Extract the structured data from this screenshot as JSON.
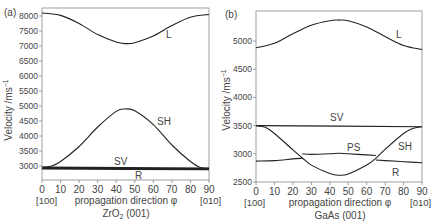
{
  "chart_data": [
    {
      "type": "line",
      "panel_label": "(a)",
      "title": "ZrO2 (001)",
      "xlabel": "propagation direction φ",
      "ylabel": "Velocity /ms⁻¹",
      "xlim": [
        0,
        90
      ],
      "ylim": [
        2530,
        8250
      ],
      "x_ticks": [
        0,
        10,
        20,
        30,
        40,
        50,
        60,
        70,
        80,
        90
      ],
      "y_ticks": [
        3000,
        3500,
        4000,
        4500,
        5000,
        5500,
        6000,
        6500,
        7000,
        7500,
        8000
      ],
      "x_end_labels": [
        "[100]",
        "[010]"
      ],
      "grid": false,
      "series": [
        {
          "name": "L",
          "x": [
            0,
            10,
            20,
            30,
            40,
            45,
            50,
            60,
            70,
            80,
            90
          ],
          "values": [
            8100,
            8020,
            7750,
            7380,
            7130,
            7080,
            7110,
            7330,
            7680,
            7960,
            8050
          ]
        },
        {
          "name": "SH",
          "x": [
            0,
            5,
            10,
            20,
            30,
            40,
            45,
            50,
            60,
            70,
            80,
            85,
            90
          ],
          "values": [
            2950,
            3000,
            3150,
            3650,
            4300,
            4820,
            4900,
            4840,
            4380,
            3700,
            3150,
            2960,
            2920
          ]
        },
        {
          "name": "SV",
          "x": [
            0,
            90
          ],
          "values": [
            2950,
            2920
          ]
        },
        {
          "name": "R",
          "x": [
            0,
            90
          ],
          "values": [
            2910,
            2890
          ]
        }
      ]
    },
    {
      "type": "line",
      "panel_label": "(b)",
      "title": "GaAs (001)",
      "xlabel": "propagation direction φ",
      "ylabel": "Velocity /ms⁻¹",
      "xlim": [
        0,
        90
      ],
      "ylim": [
        2490,
        5550
      ],
      "x_ticks": [
        0,
        10,
        20,
        30,
        40,
        50,
        60,
        70,
        80,
        90
      ],
      "y_ticks": [
        2500,
        3000,
        3500,
        4000,
        4500,
        5000
      ],
      "x_end_labels": [
        "[100]",
        "[010]"
      ],
      "grid": false,
      "series": [
        {
          "name": "L",
          "x": [
            0,
            10,
            20,
            30,
            40,
            45,
            50,
            60,
            70,
            80,
            90
          ],
          "values": [
            4880,
            4960,
            5130,
            5280,
            5360,
            5370,
            5360,
            5250,
            5080,
            4920,
            4850
          ]
        },
        {
          "name": "SV",
          "x": [
            0,
            90
          ],
          "values": [
            3500,
            3480
          ]
        },
        {
          "name": "SH",
          "x": [
            0,
            5,
            10,
            20,
            25,
            30,
            40,
            45,
            50,
            60,
            65,
            70,
            80,
            85,
            90
          ],
          "values": [
            3500,
            3470,
            3360,
            3070,
            2930,
            2800,
            2650,
            2620,
            2640,
            2800,
            2920,
            3080,
            3360,
            3450,
            3480
          ]
        },
        {
          "name": "PS",
          "x": [
            25,
            30,
            40,
            45,
            50,
            60,
            65
          ],
          "values": [
            3000,
            2990,
            3000,
            3010,
            3000,
            2980,
            2970
          ]
        },
        {
          "name": "R",
          "x": [
            0,
            10,
            20,
            25,
            45,
            65,
            70,
            80,
            90
          ],
          "values": [
            2870,
            2880,
            2910,
            2920,
            null,
            2890,
            2880,
            2860,
            2840
          ]
        }
      ]
    }
  ],
  "panels": {
    "a": {
      "label": "(a)",
      "ylabel": "Velocity /ms",
      "ylabel_sup": "−1",
      "xlabel": "propagation direction φ",
      "caption_pre": "ZrO",
      "caption_sub": "2",
      "caption_post": " (001)",
      "left_dir": "[100]",
      "right_dir": "[010]",
      "curve_labels": {
        "L": "L",
        "SH": "SH",
        "SV": "SV",
        "R": "R"
      }
    },
    "b": {
      "label": "(b)",
      "ylabel": "Velocity /ms",
      "ylabel_sup": "−1",
      "xlabel": "propagation direction φ",
      "caption": "GaAs (001)",
      "left_dir": "[100]",
      "right_dir": "[010]",
      "curve_labels": {
        "L": "L",
        "SV": "SV",
        "PS": "PS",
        "SH": "SH",
        "R": "R"
      }
    }
  }
}
